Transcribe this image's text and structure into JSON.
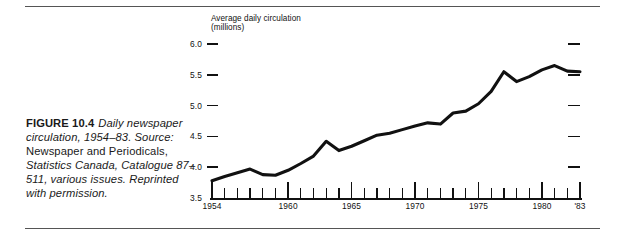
{
  "figure": {
    "caption_label": "FIGURE 10.4",
    "caption_italic_1": "Daily newspaper circulation, 1954–83. Source:",
    "caption_roman_1": "Newspaper and Periodicals,",
    "caption_italic_2": "Statistics Canada, Catalogue 87–511, various issues. Reprinted with permission."
  },
  "chart_data": {
    "type": "line",
    "title": "",
    "axis_title": "Average daily circulation\n(millions)",
    "xlabel": "",
    "ylabel": "Average daily circulation (millions)",
    "ylim": [
      3.5,
      6.0
    ],
    "xlim": [
      1954,
      1983
    ],
    "yticks": [
      "3.5",
      "4.0",
      "4.5",
      "5.0",
      "5.5",
      "6.0"
    ],
    "ytick_values": [
      3.5,
      4.0,
      4.5,
      5.0,
      5.5,
      6.0
    ],
    "right_ticks": [
      4.0,
      4.5,
      5.0,
      5.5,
      6.0
    ],
    "xticks_major": [
      1954,
      1960,
      1965,
      1970,
      1975,
      1980,
      1983
    ],
    "xtick_labels": [
      "1954",
      "1960",
      "1965",
      "1970",
      "1975",
      "1980",
      "'83"
    ],
    "grid": false,
    "legend": "none",
    "line_color": "#111111",
    "x": [
      1954,
      1955,
      1956,
      1957,
      1958,
      1959,
      1960,
      1961,
      1962,
      1963,
      1964,
      1965,
      1966,
      1967,
      1968,
      1969,
      1970,
      1971,
      1972,
      1973,
      1974,
      1975,
      1976,
      1977,
      1978,
      1979,
      1980,
      1981,
      1982,
      1983
    ],
    "values": [
      3.78,
      3.85,
      3.91,
      3.97,
      3.88,
      3.87,
      3.95,
      4.06,
      4.18,
      4.42,
      4.27,
      4.34,
      4.43,
      4.52,
      4.55,
      4.61,
      4.67,
      4.72,
      4.7,
      4.88,
      4.91,
      5.03,
      5.23,
      5.55,
      5.39,
      5.47,
      5.58,
      5.65,
      5.56,
      5.55
    ],
    "series": [
      {
        "name": "Average daily circulation",
        "values": [
          3.78,
          3.85,
          3.91,
          3.97,
          3.88,
          3.87,
          3.95,
          4.06,
          4.18,
          4.42,
          4.27,
          4.34,
          4.43,
          4.52,
          4.55,
          4.61,
          4.67,
          4.72,
          4.7,
          4.88,
          4.91,
          5.03,
          5.23,
          5.55,
          5.39,
          5.47,
          5.58,
          5.65,
          5.56,
          5.55
        ]
      }
    ]
  }
}
